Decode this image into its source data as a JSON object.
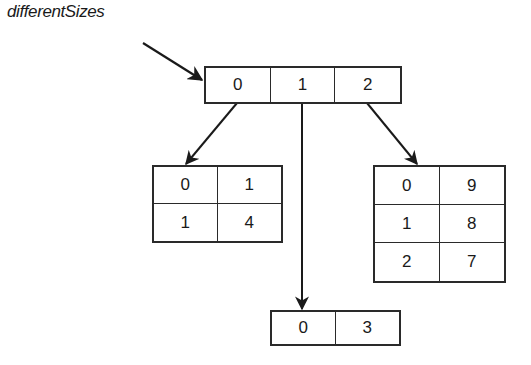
{
  "diagram": {
    "label": "differentSizes",
    "top_array": [
      "0",
      "1",
      "2"
    ],
    "left_table": [
      [
        "0",
        "1"
      ],
      [
        "1",
        "4"
      ]
    ],
    "right_table": [
      [
        "0",
        "9"
      ],
      [
        "1",
        "8"
      ],
      [
        "2",
        "7"
      ]
    ],
    "bottom_array": [
      "0",
      "3"
    ],
    "line_color": "#2a2a2a"
  }
}
